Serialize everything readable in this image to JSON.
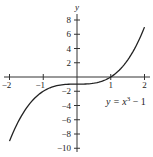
{
  "chart_data": {
    "type": "line",
    "title": "",
    "xlabel": "",
    "ylabel": "y",
    "xlim": [
      -2,
      2
    ],
    "ylim": [
      -10,
      8
    ],
    "grid": false,
    "x_ticks": [
      -2,
      -1,
      1,
      2
    ],
    "x_tick_labels": [
      "−2",
      "−1",
      "1",
      "2"
    ],
    "y_ticks": [
      8,
      6,
      4,
      2,
      -2,
      -4,
      -6,
      -8,
      -10
    ],
    "y_tick_labels": [
      "8",
      "6",
      "4",
      "2",
      "−2",
      "−4",
      "−6",
      "−8",
      "−10"
    ],
    "series": [
      {
        "name": "y = x^3 - 1",
        "x": [
          -2,
          -1.75,
          -1.5,
          -1.25,
          -1,
          -0.75,
          -0.5,
          -0.25,
          0,
          0.25,
          0.5,
          0.75,
          1,
          1.25,
          1.5,
          1.75,
          2
        ],
        "values": [
          -9,
          -6.36,
          -4.38,
          -2.95,
          -2,
          -1.42,
          -1.13,
          -1.02,
          -1,
          -0.98,
          -0.88,
          -0.58,
          0,
          0.95,
          2.38,
          4.36,
          7
        ]
      }
    ],
    "annotations": [
      {
        "text_main": "y = x",
        "superscript": "3",
        "text_tail": " − 1",
        "position": "right, below x-axis"
      }
    ],
    "color": "#222222"
  }
}
